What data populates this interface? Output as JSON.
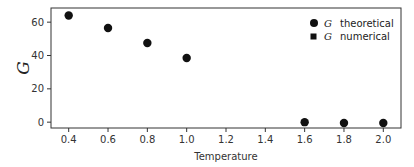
{
  "chart_data": {
    "type": "scatter",
    "title": "",
    "xlabel": "Temperature",
    "ylabel": "G",
    "xlim": [
      0.31,
      2.09
    ],
    "ylim": [
      -3.5,
      68.5
    ],
    "xticks": [
      0.4,
      0.6,
      0.8,
      1.0,
      1.2,
      1.4,
      1.6,
      1.8,
      2.0
    ],
    "xtick_labels": [
      "0.4",
      "0.6",
      "0.8",
      "1.0",
      "1.2",
      "1.4",
      "1.6",
      "1.8",
      "2.0"
    ],
    "yticks": [
      0,
      20,
      40,
      60
    ],
    "ytick_labels": [
      "0",
      "20",
      "40",
      "60"
    ],
    "grid": false,
    "legend_position": "upper right",
    "series": [
      {
        "name": "G theoretical",
        "marker": "circle",
        "color": "#111111",
        "x": [
          0.4,
          0.6,
          0.8,
          1.0,
          1.6,
          1.8,
          2.0
        ],
        "y": [
          64,
          56.5,
          47.5,
          38.5,
          0,
          -0.5,
          -0.5
        ]
      },
      {
        "name": "G numerical",
        "marker": "square",
        "color": "#111111",
        "x": [],
        "y": []
      }
    ],
    "legend": [
      {
        "symbol": "G",
        "label": "theoretical",
        "marker": "circle"
      },
      {
        "symbol": "G",
        "label": "numerical",
        "marker": "square"
      }
    ]
  }
}
